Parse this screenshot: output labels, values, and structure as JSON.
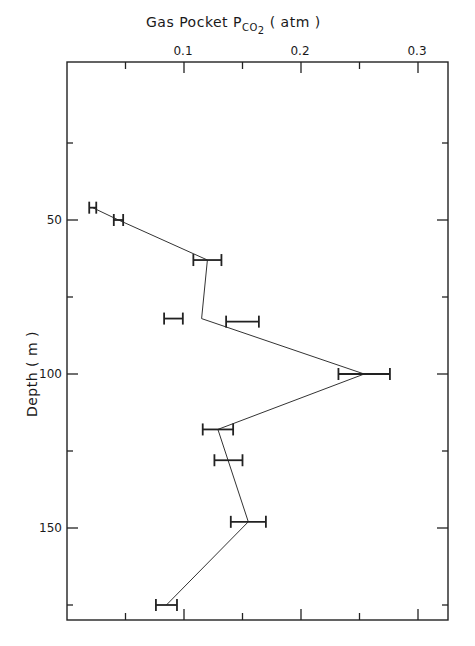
{
  "chart_data": {
    "type": "line",
    "title_parts": {
      "main": "Gas Pocket P",
      "subscript": "CO",
      "subscript2": "2",
      "unit": " ( atm )"
    },
    "xlabel": "Gas Pocket P_CO2 (atm)",
    "ylabel": "Depth  ( m )",
    "x_axis_position": "top",
    "y_axis_inverted": true,
    "xlim": [
      0,
      0.326
    ],
    "ylim": [
      0,
      180
    ],
    "x_ticks": [
      {
        "value": 0.1,
        "label": "0.1"
      },
      {
        "value": 0.2,
        "label": "0.2"
      },
      {
        "value": 0.3,
        "label": "0.3"
      }
    ],
    "x_minor_ticks": [
      0.05,
      0.15,
      0.25
    ],
    "y_ticks": [
      {
        "value": 50,
        "label": "50"
      },
      {
        "value": 100,
        "label": "100"
      },
      {
        "value": 150,
        "label": "150"
      }
    ],
    "y_minor_ticks": [
      25,
      75,
      125,
      175
    ],
    "grid": false,
    "legend": null,
    "points": [
      {
        "depth": 46,
        "pco2": 0.022,
        "err": 0.003,
        "on_line": true
      },
      {
        "depth": 50,
        "pco2": 0.044,
        "err": 0.004,
        "on_line": true
      },
      {
        "depth": 63,
        "pco2": 0.12,
        "err": 0.012,
        "on_line": true
      },
      {
        "depth": 82,
        "pco2": 0.091,
        "err": 0.008,
        "on_line": false
      },
      {
        "depth": 83,
        "pco2": 0.15,
        "err": 0.014,
        "on_line": false
      },
      {
        "depth": 100,
        "pco2": 0.254,
        "err": 0.022,
        "on_line": true
      },
      {
        "depth": 118,
        "pco2": 0.129,
        "err": 0.013,
        "on_line": true
      },
      {
        "depth": 128,
        "pco2": 0.138,
        "err": 0.012,
        "on_line": false
      },
      {
        "depth": 148,
        "pco2": 0.155,
        "err": 0.015,
        "on_line": true
      },
      {
        "depth": 175,
        "pco2": 0.085,
        "err": 0.009,
        "on_line": true
      }
    ],
    "line_path": [
      {
        "depth": 46,
        "pco2": 0.022
      },
      {
        "depth": 50,
        "pco2": 0.044
      },
      {
        "depth": 63,
        "pco2": 0.12
      },
      {
        "depth": 82,
        "pco2": 0.115
      },
      {
        "depth": 100,
        "pco2": 0.254
      },
      {
        "depth": 118,
        "pco2": 0.129
      },
      {
        "depth": 148,
        "pco2": 0.155
      },
      {
        "depth": 175,
        "pco2": 0.085
      }
    ]
  }
}
